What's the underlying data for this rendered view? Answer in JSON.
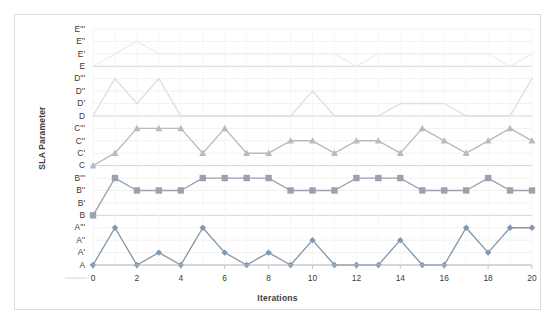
{
  "chart_data": {
    "type": "line",
    "title": "",
    "xlabel": "Iterations",
    "ylabel": "SLA Parameter",
    "grid": true,
    "legend": "none",
    "x": [
      0,
      1,
      2,
      3,
      4,
      5,
      6,
      7,
      8,
      9,
      10,
      11,
      12,
      13,
      14,
      15,
      16,
      17,
      18,
      19,
      20
    ],
    "x_tick_labels": [
      "0",
      "2",
      "4",
      "6",
      "8",
      "10",
      "12",
      "14",
      "16",
      "18",
      "20"
    ],
    "x_tick_values": [
      0,
      2,
      4,
      6,
      8,
      10,
      12,
      14,
      16,
      18,
      20
    ],
    "xlim": [
      0,
      20
    ],
    "y_tick_labels": [
      "A",
      "A'",
      "A''",
      "A'''",
      "B",
      "B'",
      "B''",
      "B'''",
      "C",
      "C'",
      "C''",
      "C'''",
      "D",
      "D'",
      "D''",
      "D'''",
      "E",
      "E'",
      "E''",
      "E'''"
    ],
    "ylim": [
      0,
      19
    ],
    "series": [
      {
        "name": "A",
        "marker": "diamond",
        "color": "#8296ad",
        "values": [
          "A",
          "A'''",
          "A",
          "A'",
          "A",
          "A'''",
          "A'",
          "A",
          "A'",
          "A",
          "A''",
          "A",
          "A",
          "A",
          "A''",
          "A",
          "A",
          "A'''",
          "A'",
          "A'''",
          "A'''"
        ],
        "level_indices": [
          0,
          3,
          0,
          1,
          0,
          3,
          1,
          0,
          1,
          0,
          2,
          0,
          0,
          0,
          2,
          0,
          0,
          3,
          1,
          3,
          3
        ]
      },
      {
        "name": "B",
        "marker": "square",
        "color": "#9aa3ad",
        "values": [
          "B",
          "B'''",
          "B''",
          "B''",
          "B''",
          "B'''",
          "B'''",
          "B'''",
          "B'''",
          "B''",
          "B''",
          "B''",
          "B'''",
          "B'''",
          "B'''",
          "B''",
          "B''",
          "B''",
          "B'''",
          "B''",
          "B''"
        ],
        "level_indices": [
          4,
          7,
          6,
          6,
          6,
          7,
          7,
          7,
          7,
          6,
          6,
          6,
          7,
          7,
          7,
          6,
          6,
          6,
          7,
          6,
          6
        ]
      },
      {
        "name": "C",
        "marker": "triangle",
        "color": "#b6bcc4",
        "values": [
          "C",
          "C'",
          "C'''",
          "C'''",
          "C'''",
          "C'",
          "C'''",
          "C'",
          "C'",
          "C''",
          "C''",
          "C'",
          "C''",
          "C''",
          "C'",
          "C'''",
          "C''",
          "C'",
          "C''",
          "C'''",
          "C''"
        ],
        "level_indices": [
          8,
          9,
          11,
          11,
          11,
          9,
          11,
          9,
          9,
          10,
          10,
          9,
          10,
          10,
          9,
          11,
          10,
          9,
          10,
          11,
          10
        ]
      },
      {
        "name": "D",
        "marker": "none",
        "color": "#dde0e3",
        "values": [
          "D",
          "D'''",
          "D'",
          "D'''",
          "D",
          "D",
          "D",
          "D",
          "D",
          "D",
          "D''",
          "D",
          "D",
          "D",
          "D'",
          "D'",
          "D'",
          "D",
          "D",
          "D",
          "D'''"
        ],
        "level_indices": [
          12,
          15,
          13,
          15,
          12,
          12,
          12,
          12,
          12,
          12,
          14,
          12,
          12,
          12,
          13,
          13,
          13,
          12,
          12,
          12,
          15
        ]
      },
      {
        "name": "E",
        "marker": "none",
        "color": "#eceef0",
        "values": [
          "E",
          "E'",
          "E''",
          "E'",
          "E'",
          "E'",
          "E'",
          "E'",
          "E'",
          "E'",
          "E'",
          "E'",
          "E",
          "E'",
          "E'",
          "E'",
          "E'",
          "E'",
          "E'",
          "E",
          "E'"
        ],
        "level_indices": [
          16,
          17,
          18,
          17,
          17,
          17,
          17,
          17,
          17,
          17,
          17,
          17,
          16,
          17,
          17,
          17,
          17,
          17,
          17,
          16,
          17
        ]
      }
    ]
  },
  "axes": {
    "y_title": "SLA Parameter",
    "x_title": "Iterations"
  }
}
